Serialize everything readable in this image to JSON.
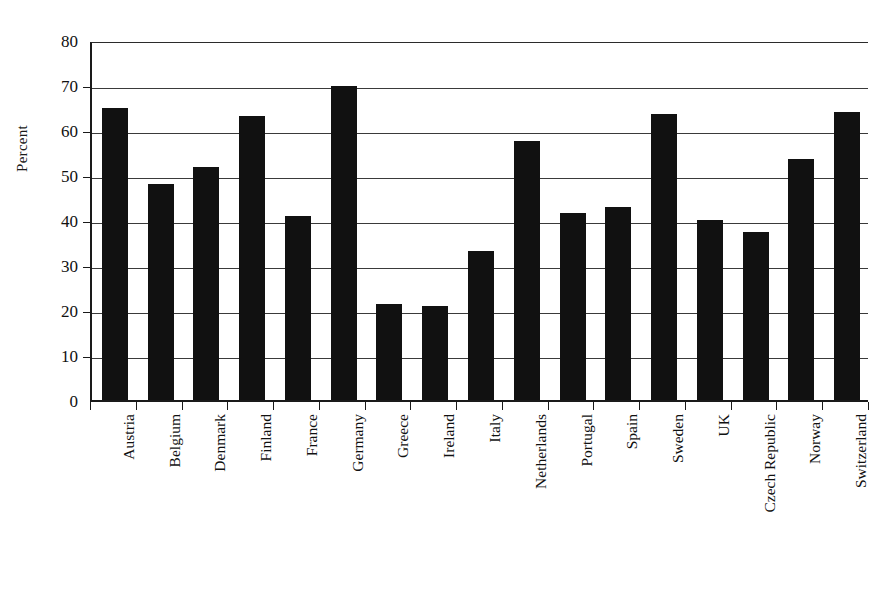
{
  "chart_data": {
    "type": "bar",
    "title": "",
    "xlabel": "",
    "ylabel": "Percent",
    "ylim": [
      0,
      80
    ],
    "yticks": [
      0,
      10,
      20,
      30,
      40,
      50,
      60,
      70,
      80
    ],
    "grid": true,
    "legend": "none",
    "bar_color": "#111111",
    "categories": [
      "Austria",
      "Belgium",
      "Denmark",
      "Finland",
      "France",
      "Germany",
      "Greece",
      "Ireland",
      "Italy",
      "Netherlands",
      "Portugal",
      "Spain",
      "Sweden",
      "UK",
      "Czech Republic",
      "Norway",
      "Switzerland"
    ],
    "values": [
      65.0,
      48.1,
      51.8,
      63.2,
      40.8,
      69.8,
      21.4,
      20.8,
      33.1,
      57.6,
      41.5,
      43.0,
      63.5,
      40.0,
      37.3,
      53.5,
      64.1
    ]
  },
  "axis": {
    "y_title": "Percent",
    "y_tick_labels": [
      "0",
      "10",
      "20",
      "30",
      "40",
      "50",
      "60",
      "70",
      "80"
    ]
  }
}
